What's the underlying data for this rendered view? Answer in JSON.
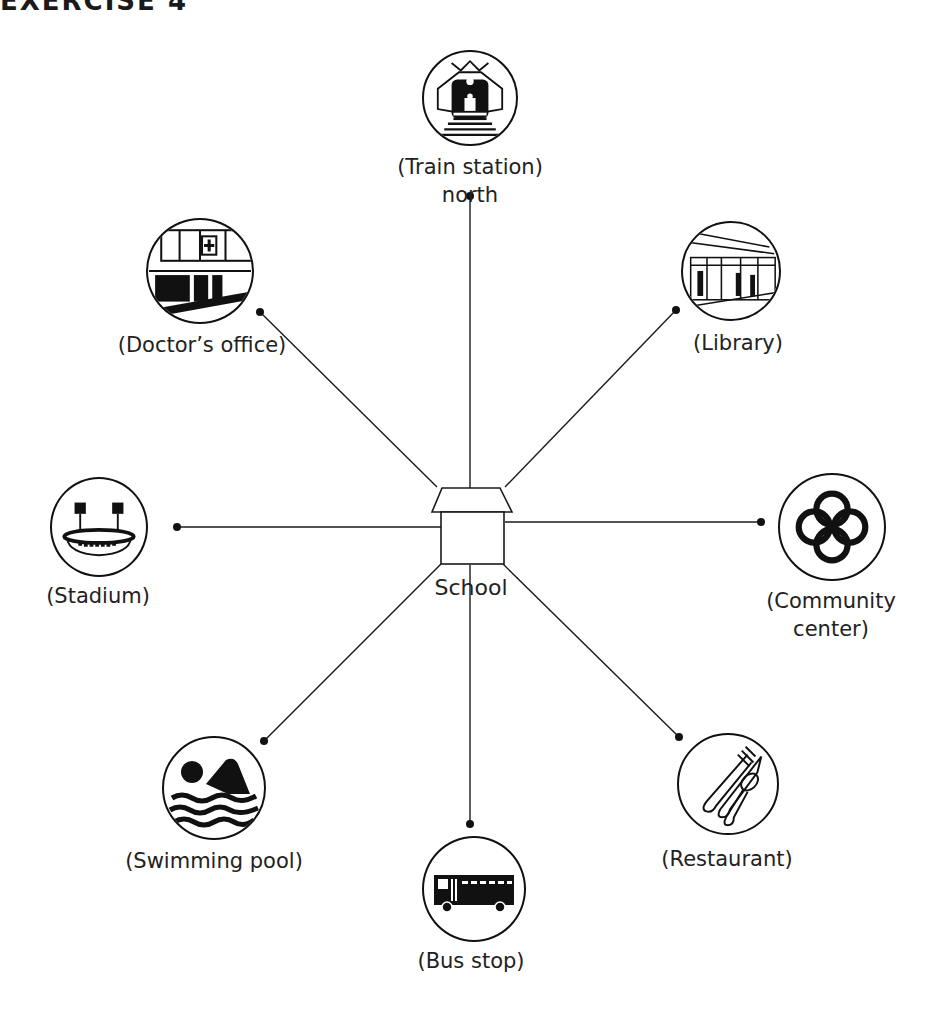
{
  "heading": "EXERCISE 4",
  "center": {
    "label": "School",
    "icon": "school-house-icon",
    "x": 470,
    "y": 530
  },
  "places": [
    {
      "id": "train-station",
      "label": "(Train station)",
      "sublabel": "north",
      "icon": "train-icon",
      "dot": [
        470,
        196
      ],
      "cx": 470,
      "cy": 98
    },
    {
      "id": "library",
      "label": "(Library)",
      "sublabel": "",
      "icon": "train-platform-icon",
      "dot": [
        676,
        310
      ],
      "cx": 736,
      "cy": 268
    },
    {
      "id": "community-center",
      "label": "(Community",
      "sublabel": "center)",
      "icon": "rings-icon",
      "dot": [
        761,
        522
      ],
      "cx": 831,
      "cy": 522
    },
    {
      "id": "restaurant",
      "label": "(Restaurant)",
      "sublabel": "",
      "icon": "cutlery-icon",
      "dot": [
        679,
        737
      ],
      "cx": 726,
      "cy": 784
    },
    {
      "id": "bus-stop",
      "label": "(Bus stop)",
      "sublabel": "",
      "icon": "bus-icon",
      "dot": [
        470,
        824
      ],
      "cx": 470,
      "cy": 890
    },
    {
      "id": "swimming-pool",
      "label": "(Swimming pool)",
      "sublabel": "",
      "icon": "swimmer-icon",
      "dot": [
        264,
        741
      ],
      "cx": 214,
      "cy": 790
    },
    {
      "id": "stadium",
      "label": "(Stadium)",
      "sublabel": "",
      "icon": "stadium-icon",
      "dot": [
        177,
        527
      ],
      "cx": 97,
      "cy": 527
    },
    {
      "id": "doctors-office",
      "label": "(Doctor’s office)",
      "sublabel": "",
      "icon": "clinic-building-icon",
      "dot": [
        260,
        312
      ],
      "cx": 200,
      "cy": 270
    }
  ],
  "colors": {
    "line": "#1a1a1a",
    "background": "#ffffff"
  }
}
